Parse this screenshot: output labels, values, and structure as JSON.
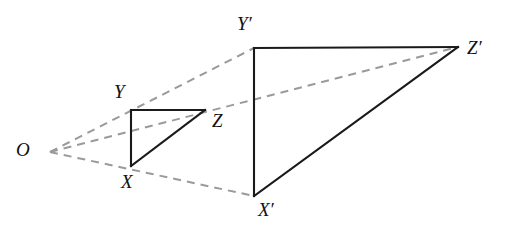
{
  "figure": {
    "canvas": {
      "width": 518,
      "height": 238,
      "background": "#ffffff"
    },
    "colors": {
      "solid_edge": "#1a1a1a",
      "projection_ray": "#9a9a9a",
      "label_text": "#111111"
    },
    "center_of_projection": {
      "name": "O",
      "label": "O",
      "x": 50,
      "y": 152,
      "label_x": 16,
      "label_y": 140
    },
    "small_triangle": {
      "name": "triangle-xyz",
      "vertices": [
        {
          "name": "X",
          "label": "X",
          "x": 131,
          "y": 166,
          "label_x": 121,
          "label_y": 172
        },
        {
          "name": "Y",
          "label": "Y",
          "x": 131,
          "y": 110,
          "label_x": 114,
          "label_y": 82
        },
        {
          "name": "Z",
          "label": "Z",
          "x": 205,
          "y": 110,
          "label_x": 212,
          "label_y": 111
        }
      ],
      "edges": [
        {
          "name": "edge-YZ",
          "from": [
            131,
            110
          ],
          "to": [
            205,
            110
          ]
        },
        {
          "name": "edge-XY",
          "from": [
            131,
            110
          ],
          "to": [
            131,
            166
          ]
        },
        {
          "name": "edge-XZ",
          "from": [
            131,
            166
          ],
          "to": [
            205,
            110
          ]
        }
      ]
    },
    "large_triangle": {
      "name": "triangle-x-prime-y-prime-z-prime",
      "vertices": [
        {
          "name": "X'",
          "label": "X′",
          "x": 254,
          "y": 196,
          "label_x": 258,
          "label_y": 200
        },
        {
          "name": "Y'",
          "label": "Y′",
          "x": 254,
          "y": 48,
          "label_x": 237,
          "label_y": 14
        },
        {
          "name": "Z'",
          "label": "Z′",
          "x": 458,
          "y": 47,
          "label_x": 467,
          "label_y": 38
        }
      ],
      "edges": [
        {
          "name": "edge-Y-prime-Z-prime",
          "from": [
            254,
            48
          ],
          "to": [
            458,
            47
          ]
        },
        {
          "name": "edge-X-prime-Y-prime",
          "from": [
            254,
            48
          ],
          "to": [
            254,
            196
          ]
        },
        {
          "name": "edge-X-prime-Z-prime",
          "from": [
            254,
            196
          ],
          "to": [
            458,
            47
          ]
        }
      ]
    },
    "projection_rays": [
      {
        "name": "ray-O-to-Y-prime",
        "through": "Y",
        "from": [
          50,
          152
        ],
        "to": [
          254,
          48
        ]
      },
      {
        "name": "ray-O-to-Z-prime",
        "through": "Z",
        "from": [
          50,
          152
        ],
        "to": [
          458,
          47
        ]
      },
      {
        "name": "ray-O-to-X-prime",
        "through": "X",
        "from": [
          50,
          152
        ],
        "to": [
          254,
          196
        ]
      }
    ]
  }
}
